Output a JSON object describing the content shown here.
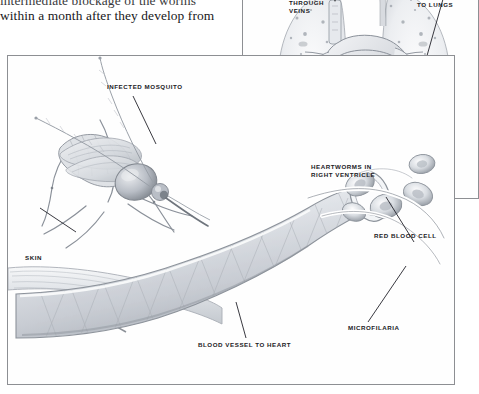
{
  "document": {
    "type": "textbook-figure-page",
    "body_text": {
      "line1": "intermediate  blockage  of  the  worms",
      "line2": "within a month after they develop from"
    }
  },
  "heart_panel": {
    "name": "heart-and-lungs-diagram",
    "labels": {
      "through_veins": "THROUGH\nVEINS",
      "to_lungs": "TO LUNGS",
      "heartworms_right_ventricle": "HEARTWORMS IN\nRIGHT VENTRICLE"
    }
  },
  "main_panel": {
    "name": "mosquito-skin-bloodvessel-diagram",
    "labels": {
      "infected_mosquito": "INFECTED MOSQUITO",
      "skin": "SKIN",
      "red_blood_cell": "RED BLOOD CELL",
      "microfilaria": "MICROFILARIA",
      "blood_vessel_to_heart": "BLOOD VESSEL TO HEART"
    }
  },
  "colors": {
    "ink": "#1b1b1e",
    "panel_border": "#8d8f93",
    "paper": "#ffffff",
    "pencil_light": "#c9ccd1",
    "pencil_mid": "#9aa0a8",
    "pencil_dark": "#6d7279"
  }
}
